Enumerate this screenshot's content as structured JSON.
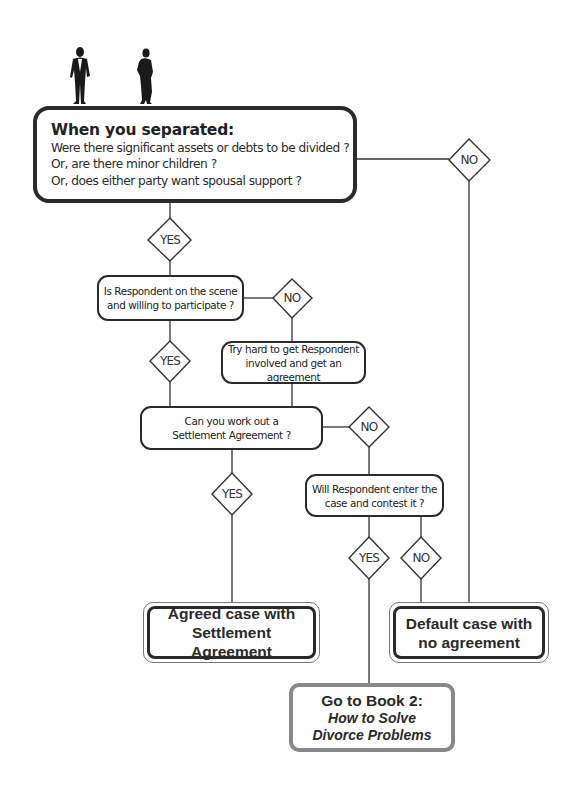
{
  "figures": {
    "man": "man-silhouette",
    "woman": "woman-silhouette"
  },
  "start": {
    "title": "When you separated:",
    "lines": [
      "Were there significant assets or debts to be divided ?",
      "Or, are there minor children ?",
      "Or, does either party want spousal support ?"
    ]
  },
  "decisions": {
    "start_yes": "YES",
    "start_no": "NO",
    "respondent_yes": "YES",
    "respondent_no": "NO",
    "settlement_yes": "YES",
    "settlement_no": "NO",
    "contest_yes": "YES",
    "contest_no": "NO"
  },
  "questions": {
    "respondent_scene": [
      "Is Respondent on the scene",
      "and willing to participate ?"
    ],
    "try_hard": [
      "Try hard to get Respondent",
      "involved and get an agreement"
    ],
    "settlement": [
      "Can you work out a",
      "Settlement Agreement ?"
    ],
    "contest": [
      "Will Respondent enter the",
      "case and contest it ?"
    ]
  },
  "outcomes": {
    "agreed": [
      "Agreed case with",
      "Settlement Agreement"
    ],
    "default": [
      "Default case with",
      "no agreement"
    ],
    "book2": {
      "line1": "Go to Book 2:",
      "line2": "How to Solve",
      "line3": "Divorce Problems"
    }
  },
  "colors": {
    "stroke": "#2a2a2a",
    "book_border": "#888888"
  }
}
